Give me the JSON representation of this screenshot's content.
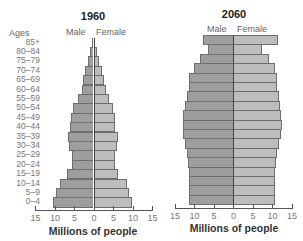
{
  "chart_data": [
    {
      "type": "bar",
      "subtype": "population-pyramid",
      "title": "1960",
      "xlabel": "Millions of people",
      "ylabel": "Ages",
      "legend": [
        "Male",
        "Female"
      ],
      "xlim": [
        -15,
        15
      ],
      "x_ticks": [
        "15",
        "10",
        "5",
        "0",
        "5",
        "10",
        "15"
      ],
      "grid": false,
      "categories": [
        "85+",
        "80–84",
        "75–79",
        "70–74",
        "65–69",
        "60–64",
        "55–59",
        "50–54",
        "45–49",
        "40–44",
        "35–39",
        "30–34",
        "25–29",
        "20–24",
        "15–19",
        "10–14",
        "5–9",
        "0–4"
      ],
      "series": [
        {
          "name": "Male",
          "values": [
            0.5,
            0.9,
            1.4,
            2.1,
            2.6,
            3.0,
            4.0,
            5.2,
            5.8,
            6.1,
            6.6,
            6.3,
            5.6,
            5.6,
            6.7,
            8.7,
            9.7,
            10.5
          ]
        },
        {
          "name": "Female",
          "values": [
            0.5,
            1.0,
            1.5,
            2.1,
            2.6,
            3.1,
            4.1,
            4.9,
            5.4,
            5.6,
            6.2,
            5.9,
            5.4,
            5.4,
            6.2,
            8.5,
            9.2,
            9.8
          ]
        }
      ]
    },
    {
      "type": "bar",
      "subtype": "population-pyramid",
      "title": "2060",
      "xlabel": "Millions of people",
      "legend": [
        "Male",
        "Female"
      ],
      "xlim": [
        -15,
        15
      ],
      "x_ticks": [
        "15",
        "10",
        "5",
        "0",
        "5",
        "10",
        "15"
      ],
      "grid": false,
      "categories": [
        "85+",
        "80–84",
        "75–79",
        "70–74",
        "65–69",
        "60–64",
        "55–59",
        "50–54",
        "45–49",
        "40–44",
        "35–39",
        "30–34",
        "25–29",
        "20–24",
        "15–19",
        "10–14",
        "5–9",
        "0–4"
      ],
      "series": [
        {
          "name": "Male",
          "values": [
            7.7,
            6.4,
            8.5,
            10.0,
            11.2,
            11.4,
            11.9,
            12.3,
            12.7,
            12.8,
            12.7,
            12.3,
            11.8,
            11.5,
            11.3,
            11.2,
            11.2,
            11.2
          ]
        },
        {
          "name": "Female",
          "values": [
            11.5,
            7.4,
            9.2,
            10.8,
            11.3,
            11.4,
            11.7,
            12.1,
            12.4,
            12.5,
            12.3,
            11.8,
            11.3,
            11.0,
            10.8,
            10.8,
            10.8,
            10.8
          ]
        }
      ]
    }
  ],
  "labels": {
    "ages_header": "Ages",
    "male": "Male",
    "female": "Female",
    "xlabel": "Millions of people",
    "title_1960": "1960",
    "title_2060": "2060"
  },
  "colors": {
    "male": "#9e9e9e",
    "female": "#bdbdbd",
    "border": "#6e6e6e"
  }
}
